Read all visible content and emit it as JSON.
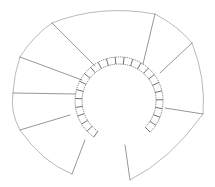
{
  "diagram": {
    "title": "",
    "colors": {
      "background": "#ffffff",
      "stroke": "#6a6a6a",
      "ring": "#444444"
    },
    "outer_path": "M72,174 Q42,162 20,130 Q10,112 13,93 Q14,74 20,57 Q33,36 52,23 Q100,4 155,14 Q178,26 192,43 Q206,78 203,114 Q170,160 130,180",
    "start_edge": {
      "x1": 85,
      "y1": 140,
      "x2": 72,
      "y2": 174
    },
    "end_edge": {
      "x1": 125,
      "y1": 145,
      "x2": 130,
      "y2": 180
    },
    "treads": [
      {
        "x1": 20,
        "y1": 130,
        "x2": 70,
        "y2": 115
      },
      {
        "x1": 13,
        "y1": 93,
        "x2": 75,
        "y2": 94
      },
      {
        "x1": 20,
        "y1": 57,
        "x2": 82,
        "y2": 80
      },
      {
        "x1": 52,
        "y1": 23,
        "x2": 95,
        "y2": 66
      },
      {
        "x1": 155,
        "y1": 14,
        "x2": 143,
        "y2": 64
      },
      {
        "x1": 192,
        "y1": 43,
        "x2": 160,
        "y2": 73
      },
      {
        "x1": 203,
        "y1": 114,
        "x2": 165,
        "y2": 108
      }
    ],
    "inner_ring": {
      "cx": 119,
      "cy": 101,
      "r_inner": 37,
      "r_outer": 44,
      "start_deg": 125,
      "end_deg": 405,
      "blocks": 24
    }
  }
}
